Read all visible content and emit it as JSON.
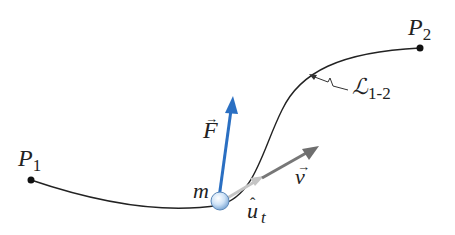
{
  "diagram": {
    "points": [
      {
        "id": "P1",
        "label": "P",
        "subscript": "1"
      },
      {
        "id": "P2",
        "label": "P",
        "subscript": "2"
      }
    ],
    "particle": {
      "label": "m"
    },
    "vectors": {
      "force": {
        "label": "F",
        "accent": "→",
        "color": "#2a6fc2"
      },
      "velocity": {
        "label": "v",
        "accent": "→",
        "color": "#6e6e6e"
      },
      "unit_tangent": {
        "label": "u",
        "accent": "ˆ",
        "subscript": "t",
        "color": "#b8b8b8"
      }
    },
    "path": {
      "label": "ℒ",
      "subscript": "1-2"
    },
    "colors": {
      "curve": "#222222",
      "ball_fill": "#cfe3f7",
      "ball_stroke": "#4a7fb8"
    }
  }
}
